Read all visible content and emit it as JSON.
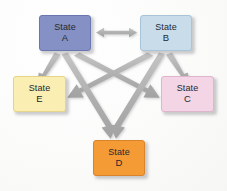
{
  "diagram": {
    "background_color": "#fdfdfc",
    "arrow_color": "#b3b3b3",
    "nodes": [
      {
        "id": "A",
        "label_top": "State",
        "label_bottom": "A",
        "fill": "#8591c4",
        "border": "#6b78af",
        "x": 39,
        "y": 15,
        "w": 52,
        "h": 36
      },
      {
        "id": "B",
        "label_top": "State",
        "label_bottom": "B",
        "fill": "#c9dcea",
        "border": "#a9c4d8",
        "x": 140,
        "y": 15,
        "w": 52,
        "h": 36
      },
      {
        "id": "E",
        "label_top": "State",
        "label_bottom": "E",
        "fill": "#fbeeb2",
        "border": "#e6d489",
        "x": 13,
        "y": 76,
        "w": 53,
        "h": 36
      },
      {
        "id": "C",
        "label_top": "State",
        "label_bottom": "C",
        "fill": "#f3d5e5",
        "border": "#dfb4cd",
        "x": 161,
        "y": 76,
        "w": 53,
        "h": 36
      },
      {
        "id": "D",
        "label_top": "State",
        "label_bottom": "D",
        "fill": "#f49b35",
        "border": "#d9832a",
        "x": 93,
        "y": 140,
        "w": 52,
        "h": 36
      }
    ],
    "edges": [
      {
        "id": "a-b",
        "from": "A",
        "to": "B",
        "kind": "bidirectional",
        "orientation": "horizontal"
      },
      {
        "id": "a-e",
        "from": "A",
        "to": "E",
        "kind": "directed",
        "orientation": "down-left"
      },
      {
        "id": "b-c",
        "from": "B",
        "to": "C",
        "kind": "directed",
        "orientation": "down-right"
      },
      {
        "id": "a-c",
        "from": "A",
        "to": "C",
        "kind": "directed",
        "orientation": "down-right-long"
      },
      {
        "id": "b-e",
        "from": "B",
        "to": "E",
        "kind": "directed",
        "orientation": "down-left-long"
      },
      {
        "id": "a-d",
        "from": "A",
        "to": "D",
        "kind": "directed",
        "orientation": "down-right-to-d"
      },
      {
        "id": "b-d",
        "from": "B",
        "to": "D",
        "kind": "directed",
        "orientation": "down-left-to-d"
      }
    ]
  }
}
